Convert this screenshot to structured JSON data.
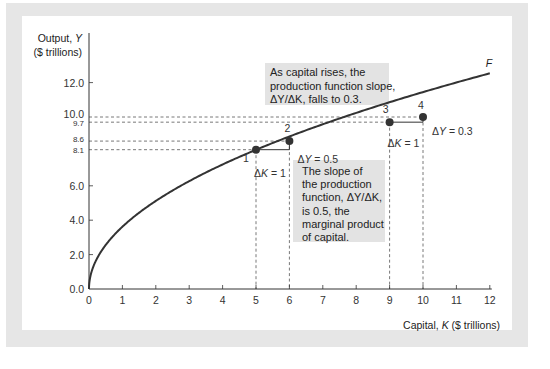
{
  "chart_data": {
    "type": "line",
    "title": "",
    "xlabel": "Capital, K ($ trillions)",
    "xlabel_parts": [
      "Capital, ",
      "K",
      " ($ trillions)"
    ],
    "ylabel": [
      "Output, Y",
      "($ trillions)"
    ],
    "ylabel_parts": [
      "Output, ",
      "Y"
    ],
    "xlim": [
      0,
      12
    ],
    "ylim": [
      0,
      12
    ],
    "x_ticks": [
      0,
      1,
      2,
      3,
      4,
      5,
      6,
      7,
      8,
      9,
      10,
      11,
      12
    ],
    "x_tick_labels": [
      "0",
      "1",
      "2",
      "3",
      "4",
      "5",
      "6",
      "7",
      "8",
      "9",
      "10",
      "11",
      "12"
    ],
    "y_ticks": [
      0,
      2,
      4,
      6,
      12
    ],
    "y_tick_labels": [
      "0.0",
      "2.0",
      "4.0",
      "6.0",
      "12.0"
    ],
    "y_ref_ticks": [
      8.1,
      8.6,
      9.7,
      10.0
    ],
    "y_ref_tick_labels": [
      "8.1",
      "8.6",
      "9.7",
      "10.0"
    ],
    "grid": false,
    "series": [
      {
        "name": "F",
        "description": "Production function",
        "formula_approx": "Y = 3.62 * K^0.5",
        "x_end": 12,
        "color": "#333333"
      }
    ],
    "points": [
      {
        "label": "1",
        "x": 5,
        "y": 8.1
      },
      {
        "label": "2",
        "x": 6,
        "y": 8.6
      },
      {
        "label": "3",
        "x": 9,
        "y": 9.7
      },
      {
        "label": "4",
        "x": 10,
        "y": 10.0
      }
    ],
    "delta_labels": [
      {
        "text": "ΔK = 1",
        "near": "points 1-2"
      },
      {
        "text": "ΔY = 0.5",
        "near": "points 1-2"
      },
      {
        "text": "ΔK = 1",
        "near": "points 3-4"
      },
      {
        "text": "ΔY = 0.3",
        "near": "points 3-4"
      }
    ],
    "annotations": [
      {
        "id": "top-box",
        "lines": [
          "As capital rises, the",
          "production function slope,",
          "ΔY/ΔK, falls to 0.3."
        ]
      },
      {
        "id": "bottom-box",
        "lines": [
          "The slope of",
          "the production",
          "function, ΔY/ΔK,",
          "is 0.5, the",
          "marginal product",
          "of capital."
        ]
      }
    ],
    "curve_label": "F",
    "colors": {
      "curve": "#333333",
      "annotation_box": "#e3e3e3",
      "frame": "#e6e6e6",
      "dashed": "#555555"
    }
  }
}
